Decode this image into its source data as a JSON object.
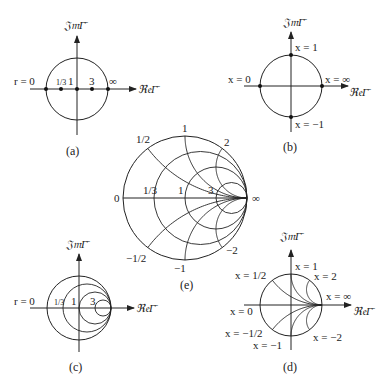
{
  "figure": {
    "axis_labels": {
      "imag": "𝔍𝔪Γ̄",
      "real": "ℜ𝔢Γ̄"
    },
    "panels": {
      "a": {
        "caption": "(a)",
        "description": "constant-r points on the real axis",
        "prefix": "r = 0",
        "point_labels": [
          "1/3",
          "1",
          "3",
          "∞"
        ],
        "r_values": [
          0,
          0.3333,
          1,
          3,
          "inf"
        ]
      },
      "b": {
        "caption": "(b)",
        "description": "constant-x points on the unit circle",
        "labels": {
          "top": "x = 1",
          "left": "x = 0",
          "right": "x = ∞",
          "bottom": "x = −1"
        },
        "x_values": [
          0,
          1,
          -1,
          "inf"
        ]
      },
      "c": {
        "caption": "(c)",
        "description": "constant-resistance circles",
        "prefix": "r = 0",
        "circle_labels": [
          "1/3",
          "1",
          "3"
        ],
        "r_values": [
          0,
          0.3333,
          1,
          3
        ]
      },
      "d": {
        "caption": "(d)",
        "description": "constant-reactance arcs",
        "labels": {
          "x_half": "x = 1/2",
          "x_one": "x = 1",
          "x_two": "x = 2",
          "x_inf": "x = ∞",
          "x_zero": "x = 0",
          "x_neg_half": "x = −1/2",
          "x_neg_one": "x = −1",
          "x_neg_two": "x = −2"
        },
        "x_values": [
          0.5,
          1,
          2,
          -0.5,
          -1,
          -2
        ]
      },
      "e": {
        "caption": "(e)",
        "description": "complete Smith chart (r circles and x arcs)",
        "r_labels": [
          "0",
          "1/3",
          "1",
          "3"
        ],
        "x_labels": {
          "pos_half": "1/2",
          "pos_one": "1",
          "pos_two": "2",
          "neg_half": "−1/2",
          "neg_one": "−1",
          "neg_two": "−2"
        },
        "inf_label": "∞",
        "r_values": [
          0.3333,
          1,
          3
        ],
        "x_values": [
          0.5,
          1,
          2,
          -0.5,
          -1,
          -2
        ]
      }
    }
  }
}
